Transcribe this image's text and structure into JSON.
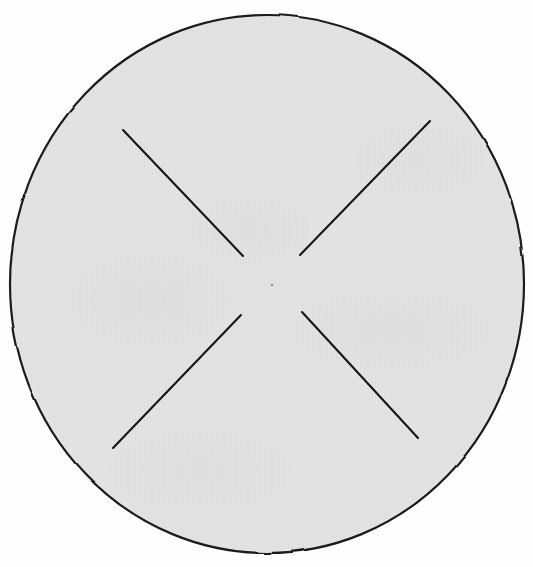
{
  "figure": {
    "background_color": "#fefefe",
    "canvas": {
      "width": 533,
      "height": 567
    }
  },
  "disc": {
    "label": "circle-outline",
    "fill_color": "#e3e3e3",
    "stroke_color": "#1a1a1a",
    "stroke_width": 2.2,
    "center_x": 267,
    "center_y": 284,
    "radius_x": 257,
    "radius_y": 269
  },
  "center_mark": {
    "label": "center-dot",
    "x": 272,
    "y": 285,
    "radius": 1.1,
    "color": "#7a7a7a"
  },
  "chart_data": {
    "type": "scatter",
    "xlabel": "",
    "ylabel": "",
    "xlim": [
      0,
      533
    ],
    "ylim": [
      0,
      567
    ],
    "grid": false,
    "legend": "none",
    "shapes": [
      {
        "kind": "ellipse",
        "name": "disc",
        "cx": 267,
        "cy": 284,
        "rx": 257,
        "ry": 269,
        "fill": "#e3e3e3",
        "stroke": "#1a1a1a",
        "stroke_width": 2.2
      },
      {
        "kind": "line",
        "name": "segment-upper-left",
        "x1": 123,
        "y1": 130,
        "x2": 243,
        "y2": 256,
        "stroke": "#141414",
        "stroke_width": 2.1
      },
      {
        "kind": "line",
        "name": "segment-upper-right",
        "x1": 430,
        "y1": 121,
        "x2": 300,
        "y2": 255,
        "stroke": "#141414",
        "stroke_width": 2.1
      },
      {
        "kind": "line",
        "name": "segment-lower-left",
        "x1": 113,
        "y1": 448,
        "x2": 241,
        "y2": 315,
        "stroke": "#141414",
        "stroke_width": 2.1
      },
      {
        "kind": "line",
        "name": "segment-lower-right",
        "x1": 418,
        "y1": 438,
        "x2": 302,
        "y2": 312,
        "stroke": "#141414",
        "stroke_width": 2.1
      }
    ],
    "annotations": []
  },
  "segments": [
    {
      "name": "upper-left",
      "x1": 123,
      "y1": 130,
      "x2": 243,
      "y2": 256,
      "color": "#141414",
      "width": 2.1
    },
    {
      "name": "upper-right",
      "x1": 430,
      "y1": 121,
      "x2": 300,
      "y2": 255,
      "color": "#141414",
      "width": 2.1
    },
    {
      "name": "lower-left",
      "x1": 113,
      "y1": 448,
      "x2": 241,
      "y2": 315,
      "color": "#141414",
      "width": 2.1
    },
    {
      "name": "lower-right",
      "x1": 418,
      "y1": 438,
      "x2": 302,
      "y2": 312,
      "color": "#141414",
      "width": 2.1
    }
  ]
}
